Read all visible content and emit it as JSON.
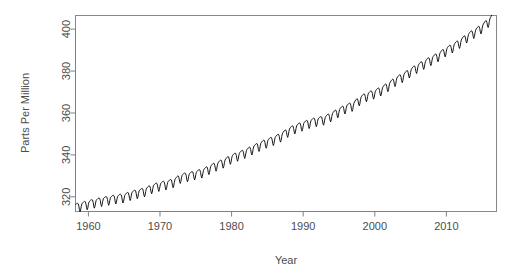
{
  "chart_data": {
    "type": "line",
    "title": "",
    "xlabel": "Year",
    "ylabel": "Parts Per Million",
    "xlim": [
      1958.2,
      2017.0
    ],
    "ylim": [
      313.0,
      406.5
    ],
    "xticks": [
      1960,
      1970,
      1980,
      1990,
      2000,
      2010
    ],
    "xtick_labels": [
      "1960",
      "1970",
      "1980",
      "1990",
      "2000",
      "2010"
    ],
    "yticks": [
      320,
      340,
      360,
      380,
      400
    ],
    "ytick_labels": [
      "320",
      "340",
      "360",
      "380",
      "400"
    ],
    "grid": false,
    "legend": false,
    "line_color": "#000000",
    "series_name": "Atmospheric CO2 concentration",
    "seasonal_amplitude_ppm": 3.1,
    "annual_trend": {
      "x": [
        1959,
        1960,
        1961,
        1962,
        1963,
        1964,
        1965,
        1966,
        1967,
        1968,
        1969,
        1970,
        1971,
        1972,
        1973,
        1974,
        1975,
        1976,
        1977,
        1978,
        1979,
        1980,
        1981,
        1982,
        1983,
        1984,
        1985,
        1986,
        1987,
        1988,
        1989,
        1990,
        1991,
        1992,
        1993,
        1994,
        1995,
        1996,
        1997,
        1998,
        1999,
        2000,
        2001,
        2002,
        2003,
        2004,
        2005,
        2006,
        2007,
        2008,
        2009,
        2010,
        2011,
        2012,
        2013,
        2014,
        2015,
        2016
      ],
      "y": [
        315.98,
        316.91,
        317.64,
        318.45,
        318.99,
        319.62,
        320.04,
        321.37,
        322.18,
        323.05,
        324.62,
        325.68,
        326.32,
        327.46,
        329.68,
        330.19,
        331.12,
        332.03,
        333.84,
        335.41,
        336.84,
        338.76,
        340.12,
        341.48,
        343.15,
        344.87,
        346.35,
        347.61,
        349.31,
        351.69,
        353.2,
        354.45,
        355.7,
        356.54,
        357.21,
        358.96,
        360.97,
        362.74,
        363.88,
        366.84,
        368.54,
        369.71,
        371.32,
        373.45,
        375.98,
        377.7,
        379.98,
        382.09,
        384.02,
        385.83,
        387.64,
        390.1,
        391.85,
        394.06,
        396.74,
        398.81,
        401.01,
        404.24
      ],
      "units": "ppm"
    },
    "data_source_label": "",
    "value_start": 315.98,
    "value_end": 404.24,
    "year_start": 1959,
    "year_end": 2016
  },
  "axes": {
    "x_title": "Year",
    "y_title": "Parts Per Million"
  }
}
